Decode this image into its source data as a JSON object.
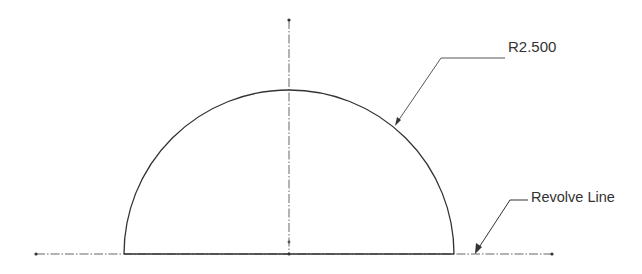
{
  "drawing": {
    "title": "Semicircle sketch with revolve axis",
    "dimension_label": "R2.500",
    "note_label": "Revolve Line",
    "colors": {
      "background": "#ffffff",
      "profile": "#333333",
      "centerline": "#555555",
      "text": "#333333"
    },
    "geometry": {
      "center": [
        289,
        254
      ],
      "radius_px": 165,
      "radius_value": 2.5,
      "profile_base_x": [
        124,
        454
      ],
      "centerline_vertical": {
        "x": 289,
        "y_top": 20,
        "y_bottom": 254
      },
      "centerline_horizontal": {
        "y": 254,
        "x_left": 36,
        "x_right": 552
      }
    }
  }
}
